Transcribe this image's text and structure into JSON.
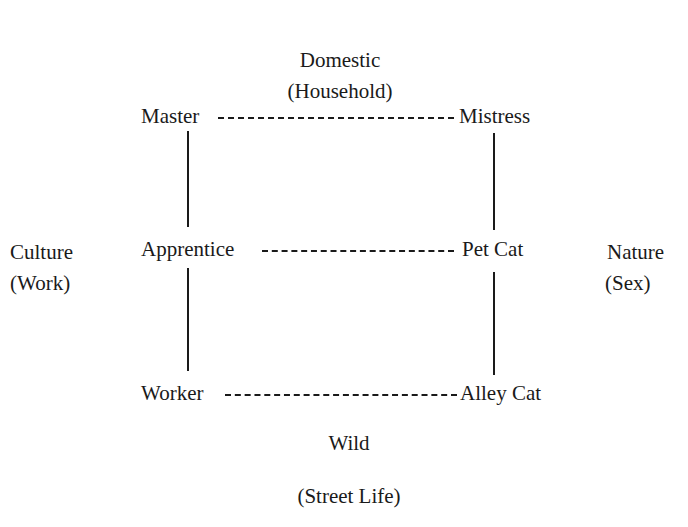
{
  "diagram": {
    "axes": {
      "top": {
        "line1": "Domestic",
        "line2": "(Household)"
      },
      "bottom": {
        "line1": "Wild",
        "line2": "(Street Life)"
      },
      "left": {
        "line1": "Culture",
        "line2": "(Work)"
      },
      "right": {
        "line1": "Nature",
        "line2": "(Sex)"
      }
    },
    "nodes": {
      "master": "Master",
      "mistress": "Mistress",
      "apprentice": "Apprentice",
      "pet_cat": "Pet Cat",
      "worker": "Worker",
      "alley_cat": "Alley Cat"
    },
    "edges": [
      {
        "from": "Master",
        "to": "Mistress",
        "style": "dashed"
      },
      {
        "from": "Apprentice",
        "to": "Pet Cat",
        "style": "dashed"
      },
      {
        "from": "Worker",
        "to": "Alley Cat",
        "style": "dashed"
      },
      {
        "from": "Master",
        "to": "Apprentice",
        "style": "solid"
      },
      {
        "from": "Apprentice",
        "to": "Worker",
        "style": "solid"
      },
      {
        "from": "Mistress",
        "to": "Pet Cat",
        "style": "solid"
      },
      {
        "from": "Pet Cat",
        "to": "Alley Cat",
        "style": "solid"
      }
    ]
  }
}
